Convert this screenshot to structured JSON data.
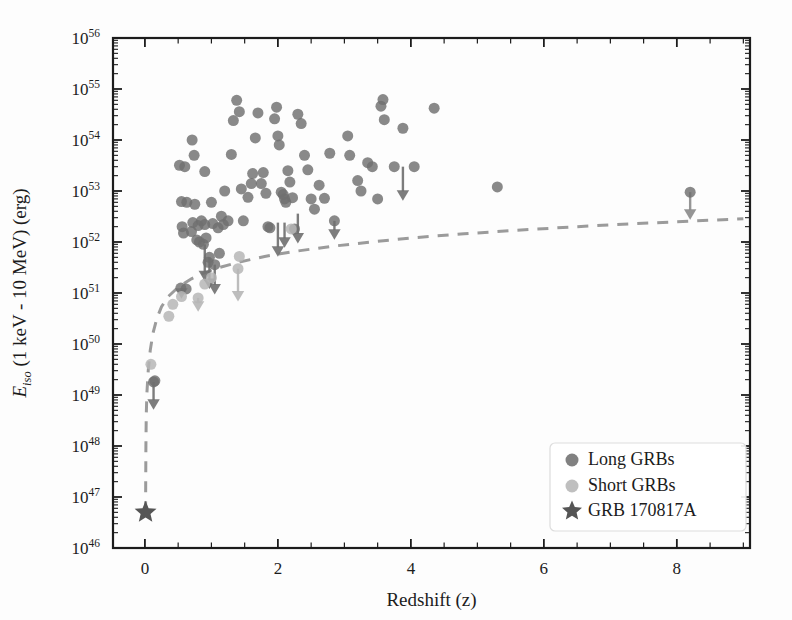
{
  "figure": {
    "background_color": "#fdfdfd",
    "axes_color": "#1c1c1c",
    "plot_area": {
      "left": 113,
      "top": 38,
      "right": 750,
      "bottom": 548
    }
  },
  "chart_data": {
    "type": "scatter",
    "title": "",
    "xlabel": "Redshift (z)",
    "ylabel_parts": {
      "symbol": "E",
      "subscript": "iso",
      "rest": " (1 keV - 10 MeV) (erg)"
    },
    "ylabel": "E_iso (1 keV - 10 MeV) (erg)",
    "xlim": [
      -0.48,
      9.1
    ],
    "ylim_log10": [
      46,
      56
    ],
    "xticks": [
      0,
      2,
      4,
      6,
      8
    ],
    "xtick_labels": [
      "0",
      "2",
      "4",
      "6",
      "8"
    ],
    "x_minor_tick_step": 0.5,
    "yticks_log10": [
      46,
      47,
      48,
      49,
      50,
      51,
      52,
      53,
      54,
      55,
      56
    ],
    "ytick_labels": [
      "10^46",
      "10^47",
      "10^48",
      "10^49",
      "10^50",
      "10^51",
      "10^52",
      "10^53",
      "10^54",
      "10^55",
      "10^56"
    ],
    "y_scale": "log",
    "grid": false,
    "legend_position": "lower right",
    "legend": [
      {
        "label": "Long GRBs",
        "marker": "circle",
        "color": "#6f6f6f"
      },
      {
        "label": "Short GRBs",
        "marker": "circle",
        "color": "#b6b6b6"
      },
      {
        "label": "GRB 170817A",
        "marker": "star",
        "color": "#555555"
      }
    ],
    "series": [
      {
        "name": "Long GRBs",
        "marker": "circle",
        "color": "#6f6f6f",
        "opacity": 0.82,
        "marker_size": 11,
        "points": [
          [
            0.13,
            1.8e+49
          ],
          [
            0.15,
            1.9e+49
          ],
          [
            0.54,
            1.25e+51
          ],
          [
            0.62,
            1.2e+51
          ],
          [
            0.52,
            3.2e+53
          ],
          [
            0.6,
            3e+53
          ],
          [
            0.55,
            6.2e+52
          ],
          [
            0.63,
            6e+52
          ],
          [
            0.56,
            2e+52
          ],
          [
            0.58,
            1.5e+52
          ],
          [
            0.7,
            1.6e+52
          ],
          [
            0.72,
            2.4e+52
          ],
          [
            0.75,
            5.5e+52
          ],
          [
            0.78,
            1.1e+52
          ],
          [
            0.8,
            2.1e+52
          ],
          [
            0.82,
            1e+52
          ],
          [
            0.85,
            2.6e+52
          ],
          [
            0.88,
            9e+51
          ],
          [
            0.9,
            2.2e+52
          ],
          [
            0.92,
            1.2e+52
          ],
          [
            0.95,
            4e+51
          ],
          [
            0.97,
            5e+51
          ],
          [
            0.71,
            1e+54
          ],
          [
            0.74,
            5e+53
          ],
          [
            0.9,
            2.4e+53
          ],
          [
            1.0,
            6e+52
          ],
          [
            1.02,
            2.3e+52
          ],
          [
            1.05,
            3.6e+51
          ],
          [
            1.1,
            1.9e+52
          ],
          [
            1.12,
            6e+51
          ],
          [
            1.15,
            3.2e+52
          ],
          [
            1.18,
            2.2e+52
          ],
          [
            1.2,
            1e+53
          ],
          [
            1.25,
            2.6e+52
          ],
          [
            1.3,
            5.2e+53
          ],
          [
            1.33,
            2.4e+54
          ],
          [
            1.38,
            6e+54
          ],
          [
            1.42,
            3.6e+54
          ],
          [
            1.45,
            1.1e+53
          ],
          [
            1.48,
            2.6e+52
          ],
          [
            1.55,
            7.5e+52
          ],
          [
            1.6,
            1.4e+53
          ],
          [
            1.62,
            2.2e+53
          ],
          [
            1.66,
            1.1e+54
          ],
          [
            1.7,
            3.4e+54
          ],
          [
            1.75,
            1.4e+53
          ],
          [
            1.78,
            2.3e+53
          ],
          [
            1.82,
            9e+52
          ],
          [
            1.85,
            2e+52
          ],
          [
            1.88,
            1.9e+52
          ],
          [
            1.95,
            2.6e+54
          ],
          [
            1.98,
            4.4e+54
          ],
          [
            2.0,
            1.2e+54
          ],
          [
            2.02,
            8e+53
          ],
          [
            2.05,
            9.5e+52
          ],
          [
            2.08,
            8.5e+52
          ],
          [
            2.1,
            7e+52
          ],
          [
            2.12,
            6e+52
          ],
          [
            2.15,
            2.5e+53
          ],
          [
            2.18,
            1.5e+53
          ],
          [
            2.22,
            7.4e+52
          ],
          [
            2.25,
            1.8e+52
          ],
          [
            2.3,
            3.2e+54
          ],
          [
            2.35,
            2.1e+54
          ],
          [
            2.4,
            5e+53
          ],
          [
            2.45,
            2.6e+53
          ],
          [
            2.5,
            7e+52
          ],
          [
            2.55,
            4.4e+52
          ],
          [
            2.62,
            1.3e+53
          ],
          [
            2.7,
            7.2e+52
          ],
          [
            2.78,
            5.5e+53
          ],
          [
            2.85,
            2.6e+52
          ],
          [
            3.05,
            1.2e+54
          ],
          [
            3.08,
            5e+53
          ],
          [
            3.2,
            1.6e+53
          ],
          [
            3.25,
            1e+53
          ],
          [
            3.35,
            3.6e+53
          ],
          [
            3.42,
            3e+53
          ],
          [
            3.5,
            7e+52
          ],
          [
            3.55,
            4.6e+54
          ],
          [
            3.58,
            6.2e+54
          ],
          [
            3.6,
            2.5e+54
          ],
          [
            3.75,
            3e+53
          ],
          [
            3.88,
            1.7e+54
          ],
          [
            4.05,
            3e+53
          ],
          [
            4.35,
            4.2e+54
          ],
          [
            5.3,
            1.2e+53
          ],
          [
            8.2,
            9.5e+52
          ]
        ]
      },
      {
        "name": "Short GRBs",
        "marker": "circle",
        "color": "#b6b6b6",
        "opacity": 0.85,
        "marker_size": 11,
        "points": [
          [
            0.09,
            4e+49
          ],
          [
            0.36,
            3.5e+50
          ],
          [
            0.42,
            6e+50
          ],
          [
            0.55,
            8.5e+50
          ],
          [
            0.8,
            8e+50
          ],
          [
            0.9,
            1.5e+51
          ],
          [
            1.0,
            2e+51
          ],
          [
            1.4,
            3e+51
          ],
          [
            1.42,
            5.2e+51
          ],
          [
            2.2,
            1.8e+52
          ]
        ]
      }
    ],
    "upper_limit_arrows": [
      {
        "z": 0.13,
        "y_top": 1.8e+49,
        "y_tip": 6e+48,
        "color": "#6f6f6f"
      },
      {
        "z": 0.55,
        "y_top": 1.25e+51,
        "y_tip": 9e+50,
        "color": "#8a8a8a"
      },
      {
        "z": 0.8,
        "y_top": 8e+50,
        "y_tip": 5e+50,
        "color": "#b6b6b6"
      },
      {
        "z": 0.9,
        "y_top": 9e+51,
        "y_tip": 2e+51,
        "color": "#6f6f6f"
      },
      {
        "z": 0.97,
        "y_top": 5e+51,
        "y_tip": 1.4e+51,
        "color": "#6f6f6f"
      },
      {
        "z": 1.05,
        "y_top": 3.6e+51,
        "y_tip": 1.1e+51,
        "color": "#6f6f6f"
      },
      {
        "z": 1.4,
        "y_top": 3e+51,
        "y_tip": 8e+50,
        "color": "#b6b6b6"
      },
      {
        "z": 2.0,
        "y_top": 2.4e+52,
        "y_tip": 6e+51,
        "color": "#6f6f6f"
      },
      {
        "z": 2.1,
        "y_top": 2.4e+52,
        "y_tip": 9e+51,
        "color": "#6f6f6f"
      },
      {
        "z": 2.3,
        "y_top": 3.6e+52,
        "y_tip": 1.1e+52,
        "color": "#6f6f6f"
      },
      {
        "z": 2.85,
        "y_top": 2.6e+52,
        "y_tip": 1.3e+52,
        "color": "#6f6f6f"
      },
      {
        "z": 3.88,
        "y_top": 3e+53,
        "y_tip": 7.5e+52,
        "color": "#6f6f6f"
      },
      {
        "z": 8.2,
        "y_top": 9.5e+52,
        "y_tip": 3.2e+52,
        "color": "#8a8a8a"
      }
    ],
    "special_point": {
      "label": "GRB 170817A",
      "marker": "star",
      "color": "#555555",
      "z": 0.0098,
      "e_iso": 5e+46
    },
    "threshold_curve": {
      "style": "dashed",
      "color": "#9b9b9b",
      "line_width": 3,
      "dash_pattern": "11 9",
      "description": "detection-sensitivity threshold vs redshift",
      "points": [
        [
          0.0098,
          5e+46
        ],
        [
          0.012,
          2e+47
        ],
        [
          0.015,
          1e+48
        ],
        [
          0.02,
          4e+48
        ],
        [
          0.03,
          1.1e+49
        ],
        [
          0.05,
          3e+49
        ],
        [
          0.08,
          7.5e+49
        ],
        [
          0.12,
          1.6e+50
        ],
        [
          0.18,
          3.2e+50
        ],
        [
          0.25,
          5.4e+50
        ],
        [
          0.35,
          8.5e+50
        ],
        [
          0.5,
          1.3e+51
        ],
        [
          0.7,
          1.9e+51
        ],
        [
          0.9,
          2.5e+51
        ],
        [
          1.1,
          3.1e+51
        ],
        [
          1.4,
          4e+51
        ],
        [
          1.8,
          5.2e+51
        ],
        [
          2.2,
          6.4e+51
        ],
        [
          2.8,
          8.2e+51
        ],
        [
          3.4,
          1e+52
        ],
        [
          4.0,
          1.2e+52
        ],
        [
          4.8,
          1.45e+52
        ],
        [
          5.6,
          1.7e+52
        ],
        [
          6.5,
          2e+52
        ],
        [
          7.4,
          2.3e+52
        ],
        [
          8.3,
          2.6e+52
        ],
        [
          9.0,
          2.85e+52
        ]
      ]
    }
  }
}
